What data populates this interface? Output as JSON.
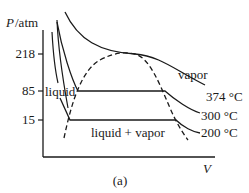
{
  "diagram": {
    "y_axis_label_italic": "P",
    "y_axis_label_unit": "/atm",
    "x_axis_label": "V",
    "caption": "(a)",
    "y_ticks": [
      "218",
      "85",
      "15"
    ],
    "regions": {
      "liquid": "liquid",
      "vapor": "vapor",
      "mixed": "liquid + vapor"
    },
    "isotherms": [
      {
        "label": "374 °C",
        "pressure": 218
      },
      {
        "label": "300 °C",
        "pressure": 85
      },
      {
        "label": "200 °C",
        "pressure": 15
      }
    ],
    "colors": {
      "line": "#1a1a1a",
      "background": "#ffffff"
    }
  }
}
